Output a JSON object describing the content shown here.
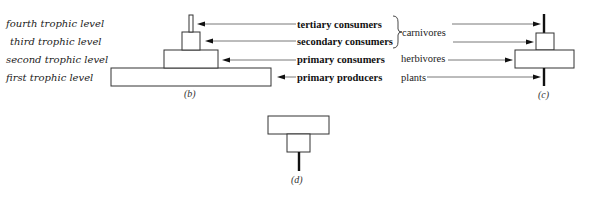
{
  "trophic_levels": [
    {
      "label": "fourth trophic level"
    },
    {
      "label": "third trophic level"
    },
    {
      "label": "second trophic level"
    },
    {
      "label": "first trophic level"
    }
  ],
  "consumer_types": [
    {
      "label": "tertiary consumers"
    },
    {
      "label": "secondary consumers"
    },
    {
      "label": "primary consumers"
    },
    {
      "label": "primary producers"
    }
  ],
  "groups": {
    "carnivores": "carnivores",
    "herbivores": "herbivores",
    "plants": "plants"
  },
  "captions": {
    "b": "(b)",
    "c": "(c)",
    "d": "(d)"
  }
}
